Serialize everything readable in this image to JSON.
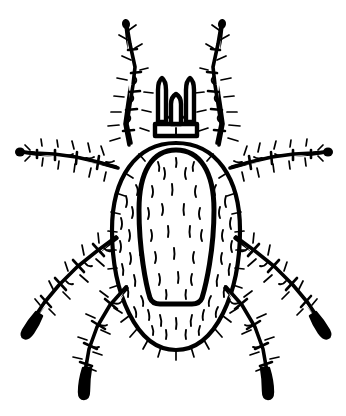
{
  "image": {
    "subject": "tick",
    "style": "black-and-white line drawing",
    "view": "dorsal",
    "background_color": "#ffffff",
    "ink_color": "#000000",
    "width": 346,
    "height": 416
  },
  "anatomy": {
    "idiosoma": {
      "label": "idiosoma",
      "shape": "oval",
      "center_x": 176,
      "center_y": 247,
      "radius_x": 64,
      "radius_y": 104,
      "outline_width": 4.2,
      "setae_count": 46
    },
    "scutum": {
      "label": "scutum",
      "shape": "elongated-u",
      "top_y": 150,
      "bottom_y": 304,
      "left_x": 139,
      "right_x": 214,
      "outline_width": 5.0,
      "setae_count": 24
    },
    "capitulum": {
      "label": "capitulum",
      "palps": [
        {
          "label": "left-palp",
          "x": 162,
          "top_y": 78,
          "bottom_y": 122
        },
        {
          "label": "right-palp",
          "x": 190,
          "top_y": 78,
          "bottom_y": 122
        }
      ],
      "hypostome": {
        "label": "hypostome",
        "x": 176,
        "top_y": 94,
        "bottom_y": 124
      }
    },
    "legs": [
      {
        "label": "leg-1-left",
        "pair": 1,
        "side": "left",
        "direction": "up-left",
        "segments": 6,
        "tip": "pointed"
      },
      {
        "label": "leg-1-right",
        "pair": 1,
        "side": "right",
        "direction": "up-right",
        "segments": 6,
        "tip": "pointed"
      },
      {
        "label": "leg-2-left",
        "pair": 2,
        "side": "left",
        "direction": "horizontal-left",
        "segments": 5,
        "tip": "rounded-knob"
      },
      {
        "label": "leg-2-right",
        "pair": 2,
        "side": "right",
        "direction": "horizontal-right",
        "segments": 5,
        "tip": "rounded-knob"
      },
      {
        "label": "leg-3-left",
        "pair": 3,
        "side": "left",
        "direction": "down-left",
        "segments": 5,
        "tip": "dark-elongated"
      },
      {
        "label": "leg-3-right",
        "pair": 3,
        "side": "right",
        "direction": "down-right",
        "segments": 5,
        "tip": "dark-elongated"
      },
      {
        "label": "leg-4-left",
        "pair": 4,
        "side": "left",
        "direction": "down",
        "segments": 5,
        "tip": "dark-elongated"
      },
      {
        "label": "leg-4-right",
        "pair": 4,
        "side": "right",
        "direction": "down",
        "segments": 5,
        "tip": "dark-elongated"
      }
    ]
  },
  "caption": {
    "text": ""
  }
}
